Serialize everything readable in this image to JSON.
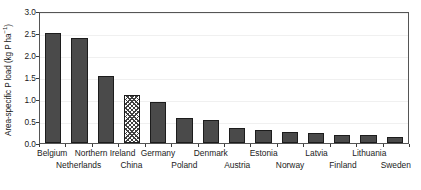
{
  "chart_data": {
    "type": "bar",
    "title": "",
    "xlabel": "",
    "ylabel": "Area-specific P load (kg P ha⁻¹)",
    "ylabel_main": "Area-specific P load (kg P ha",
    "ylabel_sup": "−1",
    "ylabel_tail": ")",
    "ylim": [
      0.0,
      3.0
    ],
    "ytick_step": 0.5,
    "grid": true,
    "legend": "none",
    "categories": [
      "Belgium",
      "Netherlands",
      "Northern Ireland",
      "China",
      "Germany",
      "Poland",
      "Denmark",
      "Austria",
      "Estonia",
      "Norway",
      "Latvia",
      "Finland",
      "Lithuania",
      "Sweden"
    ],
    "values": [
      2.5,
      2.38,
      1.53,
      1.1,
      0.93,
      0.57,
      0.53,
      0.35,
      0.3,
      0.26,
      0.22,
      0.19,
      0.18,
      0.13
    ],
    "bar_styles": [
      "solid",
      "solid",
      "solid",
      "hatched",
      "solid",
      "solid",
      "solid",
      "solid",
      "solid",
      "solid",
      "solid",
      "solid",
      "solid",
      "solid"
    ],
    "yticks": [
      "0.0",
      "0.5",
      "1.0",
      "1.5",
      "2.0",
      "2.5",
      "3.0"
    ],
    "ytick_values": [
      0.0,
      0.5,
      1.0,
      1.5,
      2.0,
      2.5,
      3.0
    ],
    "colors": {
      "bar_fill": "#4a4a4a",
      "bar_edge": "#1c1c1c",
      "hatch_line": "#3f3f3f",
      "axis": "#555555",
      "grid": "#f0f0f0",
      "text": "#1a1a1a",
      "background": "#ffffff"
    }
  }
}
